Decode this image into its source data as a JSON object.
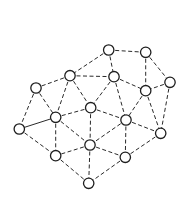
{
  "diagram": {
    "type": "graph",
    "node_radius": 5.2,
    "colors": {
      "edge": "#2a2a2a",
      "node_stroke": "#1e1e1e",
      "node_fill": "#ffffff",
      "background": "#ffffff"
    },
    "nodes": [
      {
        "id": "A",
        "x": 108.7,
        "y": 50
      },
      {
        "id": "B",
        "x": 145.7,
        "y": 52.3
      },
      {
        "id": "C",
        "x": 70,
        "y": 75.7
      },
      {
        "id": "D",
        "x": 114,
        "y": 76.7
      },
      {
        "id": "E",
        "x": 170,
        "y": 82.3
      },
      {
        "id": "F",
        "x": 36,
        "y": 88
      },
      {
        "id": "G",
        "x": 145.7,
        "y": 90.7
      },
      {
        "id": "H",
        "x": 90.7,
        "y": 107.7
      },
      {
        "id": "I",
        "x": 55.7,
        "y": 117.3
      },
      {
        "id": "J",
        "x": 126,
        "y": 120
      },
      {
        "id": "K",
        "x": 19.3,
        "y": 129
      },
      {
        "id": "L",
        "x": 160.7,
        "y": 133.3
      },
      {
        "id": "M",
        "x": 90,
        "y": 145
      },
      {
        "id": "N",
        "x": 55.7,
        "y": 155.7
      },
      {
        "id": "O",
        "x": 125.3,
        "y": 157.3
      },
      {
        "id": "P",
        "x": 88.7,
        "y": 183.3
      }
    ],
    "edges": [
      {
        "from": "A",
        "to": "B",
        "style": "dashed"
      },
      {
        "from": "A",
        "to": "C",
        "style": "dashed"
      },
      {
        "from": "A",
        "to": "D",
        "style": "dashed"
      },
      {
        "from": "B",
        "to": "G",
        "style": "dashed"
      },
      {
        "from": "B",
        "to": "E",
        "style": "dashed"
      },
      {
        "from": "C",
        "to": "D",
        "style": "dashed"
      },
      {
        "from": "C",
        "to": "F",
        "style": "dashed"
      },
      {
        "from": "C",
        "to": "H",
        "style": "dashed"
      },
      {
        "from": "C",
        "to": "I",
        "style": "dashed"
      },
      {
        "from": "D",
        "to": "G",
        "style": "dashed"
      },
      {
        "from": "D",
        "to": "H",
        "style": "dashed"
      },
      {
        "from": "D",
        "to": "J",
        "style": "dashed"
      },
      {
        "from": "E",
        "to": "G",
        "style": "dashed"
      },
      {
        "from": "E",
        "to": "L",
        "style": "dashed"
      },
      {
        "from": "F",
        "to": "K",
        "style": "dashed"
      },
      {
        "from": "F",
        "to": "I",
        "style": "dashed"
      },
      {
        "from": "G",
        "to": "J",
        "style": "dashed"
      },
      {
        "from": "G",
        "to": "L",
        "style": "dashed"
      },
      {
        "from": "H",
        "to": "I",
        "style": "dashed"
      },
      {
        "from": "H",
        "to": "J",
        "style": "dashed"
      },
      {
        "from": "H",
        "to": "M",
        "style": "dashed"
      },
      {
        "from": "I",
        "to": "K",
        "style": "solid"
      },
      {
        "from": "I",
        "to": "N",
        "style": "dashed"
      },
      {
        "from": "I",
        "to": "M",
        "style": "dashed"
      },
      {
        "from": "J",
        "to": "L",
        "style": "dashed"
      },
      {
        "from": "J",
        "to": "M",
        "style": "dashed"
      },
      {
        "from": "J",
        "to": "O",
        "style": "dashed"
      },
      {
        "from": "K",
        "to": "N",
        "style": "dashed"
      },
      {
        "from": "L",
        "to": "O",
        "style": "dashed"
      },
      {
        "from": "M",
        "to": "N",
        "style": "dashed"
      },
      {
        "from": "M",
        "to": "O",
        "style": "dashed"
      },
      {
        "from": "M",
        "to": "P",
        "style": "dashed"
      },
      {
        "from": "N",
        "to": "P",
        "style": "dashed"
      },
      {
        "from": "O",
        "to": "P",
        "style": "dashed"
      }
    ]
  }
}
